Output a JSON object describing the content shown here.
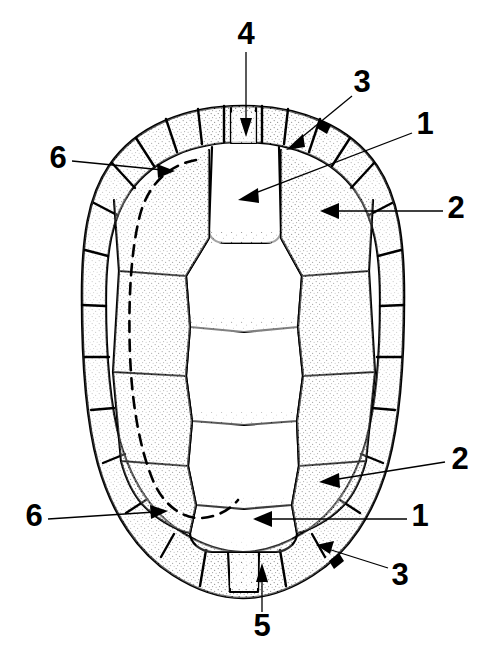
{
  "figure": {
    "view": "dorsal",
    "background_color": "#ffffff",
    "ink_color": "#000000",
    "width": 487,
    "height": 667
  },
  "labels": [
    {
      "id": "label-4",
      "text": "4",
      "x": 246,
      "y": 36,
      "points_to": "nuchal-scute"
    },
    {
      "id": "label-3-top",
      "text": "3",
      "x": 362,
      "y": 84,
      "points_to": "marginal-scute-upper-right"
    },
    {
      "id": "label-1-top",
      "text": "1",
      "x": 425,
      "y": 126,
      "points_to": "first-vertebral-scute"
    },
    {
      "id": "label-2-top",
      "text": "2",
      "x": 456,
      "y": 210,
      "points_to": "first-costal-scute-right"
    },
    {
      "id": "label-6-top",
      "text": "6",
      "x": 58,
      "y": 160,
      "points_to": "bridge-outline-upper-left"
    },
    {
      "id": "label-2-bottom",
      "text": "2",
      "x": 460,
      "y": 461,
      "points_to": "fourth-costal-scute-right"
    },
    {
      "id": "label-1-bottom",
      "text": "1",
      "x": 420,
      "y": 518,
      "points_to": "fifth-vertebral-scute"
    },
    {
      "id": "label-3-bottom",
      "text": "3",
      "x": 400,
      "y": 577,
      "points_to": "marginal-scute-lower-right"
    },
    {
      "id": "label-6-bottom",
      "text": "6",
      "x": 34,
      "y": 518,
      "points_to": "bridge-outline-lower-left"
    },
    {
      "id": "label-5",
      "text": "5",
      "x": 262,
      "y": 628,
      "points_to": "supracaudal-scute"
    }
  ],
  "legend_meaning": {
    "1": "vertebral scute",
    "2": "costal (pleural) scute",
    "3": "marginal scute",
    "4": "nuchal (cervical) scute",
    "5": "supracaudal (pygal) scute",
    "6": "bridge / plastron attachment outline (dashed)"
  },
  "leaders": [
    {
      "id": "leader-4",
      "from": [
        246,
        52
      ],
      "to": [
        246,
        133
      ],
      "arrow": "down",
      "arrow_at": [
        246,
        133
      ]
    },
    {
      "id": "leader-3-top",
      "from": [
        352,
        96
      ],
      "to": [
        290,
        147
      ],
      "arrow": "down-left",
      "arrow_at": [
        290,
        147
      ]
    },
    {
      "id": "leader-1-top",
      "from": [
        412,
        133
      ],
      "to": [
        241,
        198
      ],
      "arrow": "left",
      "arrow_at": [
        241,
        198
      ]
    },
    {
      "id": "leader-2-top",
      "from": [
        443,
        211
      ],
      "to": [
        322,
        211
      ],
      "arrow": "left",
      "arrow_at": [
        322,
        211
      ]
    },
    {
      "id": "leader-6-top",
      "from": [
        72,
        161
      ],
      "to": [
        172,
        171
      ],
      "arrow": "right",
      "arrow_at": [
        172,
        171
      ]
    },
    {
      "id": "leader-2-bottom",
      "from": [
        445,
        462
      ],
      "to": [
        321,
        482
      ],
      "arrow": "left",
      "arrow_at": [
        321,
        482
      ]
    },
    {
      "id": "leader-1-bottom",
      "from": [
        407,
        519
      ],
      "to": [
        255,
        519
      ],
      "arrow": "left",
      "arrow_at": [
        255,
        519
      ]
    },
    {
      "id": "leader-3-bottom",
      "from": [
        388,
        568
      ],
      "to": [
        318,
        545
      ],
      "arrow": "up-left",
      "arrow_at": [
        318,
        545
      ]
    },
    {
      "id": "leader-6-bottom",
      "from": [
        48,
        519
      ],
      "to": [
        165,
        510
      ],
      "arrow": "right",
      "arrow_at": [
        165,
        510
      ]
    },
    {
      "id": "leader-5",
      "from": [
        262,
        612
      ],
      "to": [
        262,
        567
      ],
      "arrow": "up",
      "arrow_at": [
        262,
        567
      ]
    }
  ],
  "anatomy": {
    "outer_rim": "carapace-outer-margin",
    "inner_rim": "marginal-scute-inner-boundary",
    "vertebral_scutes": 5,
    "costal_scutes_per_side": 4,
    "marginal_scutes_per_side": 11,
    "nuchal_scutes": 1,
    "supracaudal_scutes": 1
  }
}
